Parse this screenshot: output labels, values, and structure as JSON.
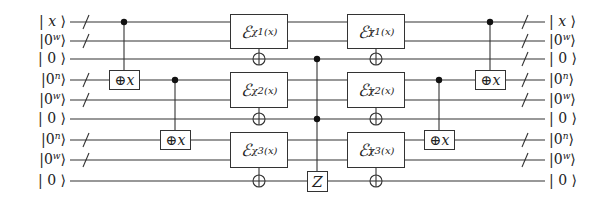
{
  "diagram": {
    "type": "quantum-circuit",
    "wires": [
      {
        "index": 1,
        "y": 22,
        "label_base": "x",
        "label_sup": "",
        "left_label": "| x ⟩",
        "right_label": "| x ⟩",
        "slash_left": true,
        "slash_right": true
      },
      {
        "index": 2,
        "y": 41,
        "label_base": "0",
        "label_sup": "w",
        "left_label": "|0ʷ⟩",
        "right_label": "|0ʷ⟩",
        "slash_left": true,
        "slash_right": true
      },
      {
        "index": 3,
        "y": 59,
        "label_base": "0",
        "label_sup": "",
        "left_label": "| 0 ⟩",
        "right_label": "| 0 ⟩",
        "slash_left": false,
        "slash_right": true
      },
      {
        "index": 4,
        "y": 80,
        "label_base": "0",
        "label_sup": "n",
        "left_label": "|0ⁿ⟩",
        "right_label": "|0ⁿ⟩",
        "slash_left": true,
        "slash_right": true
      },
      {
        "index": 5,
        "y": 100,
        "label_base": "0",
        "label_sup": "w",
        "left_label": "|0ʷ⟩",
        "right_label": "|0ʷ⟩",
        "slash_left": true,
        "slash_right": true
      },
      {
        "index": 6,
        "y": 119,
        "label_base": "0",
        "label_sup": "",
        "left_label": "| 0 ⟩",
        "right_label": "| 0 ⟩",
        "slash_left": false,
        "slash_right": false
      },
      {
        "index": 7,
        "y": 140,
        "label_base": "0",
        "label_sup": "n",
        "left_label": "|0ⁿ⟩",
        "right_label": "|0ⁿ⟩",
        "slash_left": true,
        "slash_right": true
      },
      {
        "index": 8,
        "y": 160,
        "label_base": "0",
        "label_sup": "w",
        "left_label": "|0ʷ⟩",
        "right_label": "|0ʷ⟩",
        "slash_left": true,
        "slash_right": true
      },
      {
        "index": 9,
        "y": 181,
        "label_base": "0",
        "label_sup": "",
        "left_label": "| 0 ⟩",
        "right_label": "| 0 ⟩",
        "slash_left": false,
        "slash_right": false
      }
    ],
    "wire_x_start": 70,
    "wire_x_end": 545,
    "slash_x_left": 86,
    "slash_x_right": 525,
    "gates": [
      {
        "kind": "cx",
        "name": "copy-x-1",
        "control_wire": 1,
        "target_wire": 4,
        "x": 124,
        "label_op": "⊕",
        "label_var": "x"
      },
      {
        "kind": "cx",
        "name": "copy-x-2",
        "control_wire": 4,
        "target_wire": 7,
        "x": 175,
        "label_op": "⊕",
        "label_var": "x"
      },
      {
        "kind": "E",
        "name": "E-chi1",
        "wires": [
          1,
          2
        ],
        "xor_wire": 3,
        "x": 259,
        "label_main": "ℰ",
        "label_sub": "χ1(x)",
        "dagger": false
      },
      {
        "kind": "E",
        "name": "E-chi2",
        "wires": [
          4,
          5
        ],
        "xor_wire": 6,
        "x": 259,
        "label_main": "ℰ",
        "label_sub": "χ2(x)",
        "dagger": false
      },
      {
        "kind": "E",
        "name": "E-chi3",
        "wires": [
          7,
          8
        ],
        "xor_wire": 9,
        "x": 259,
        "label_main": "ℰ",
        "label_sub": "χ3(x)",
        "dagger": false
      },
      {
        "kind": "cz",
        "name": "controlled-Z",
        "control_wires": [
          3,
          6
        ],
        "target_wire": 9,
        "x": 317,
        "label": "Z"
      },
      {
        "kind": "E",
        "name": "E-chi1-dagger",
        "wires": [
          1,
          2
        ],
        "xor_wire": 3,
        "x": 376,
        "label_main": "ℰ",
        "label_sub": "χ1(x)",
        "dagger": true
      },
      {
        "kind": "E",
        "name": "E-chi2-dagger",
        "wires": [
          4,
          5
        ],
        "xor_wire": 6,
        "x": 376,
        "label_main": "ℰ",
        "label_sub": "χ2(x)",
        "dagger": true
      },
      {
        "kind": "E",
        "name": "E-chi3-dagger",
        "wires": [
          7,
          8
        ],
        "xor_wire": 9,
        "x": 376,
        "label_main": "ℰ",
        "label_sub": "χ3(x)",
        "dagger": true
      },
      {
        "kind": "cx",
        "name": "uncopy-x-2",
        "control_wire": 4,
        "target_wire": 7,
        "x": 439,
        "label_op": "⊕",
        "label_var": "x"
      },
      {
        "kind": "cx",
        "name": "uncopy-x-1",
        "control_wire": 1,
        "target_wire": 4,
        "x": 490,
        "label_op": "⊕",
        "label_var": "x"
      }
    ],
    "colors": {
      "line": "#333333",
      "text": "#222222",
      "background": "#ffffff"
    }
  }
}
